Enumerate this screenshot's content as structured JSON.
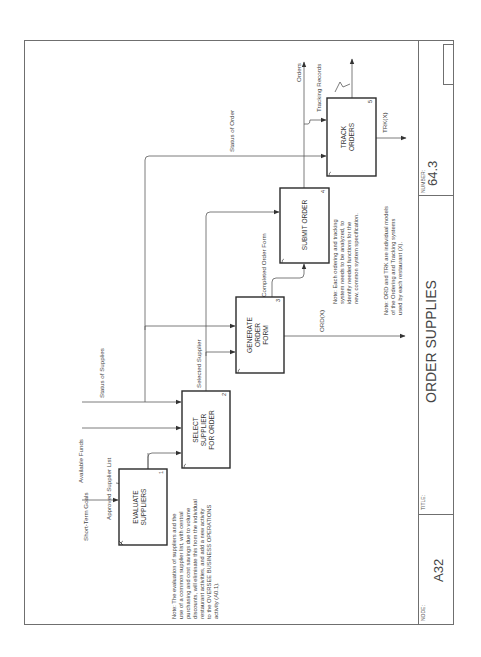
{
  "diagram": {
    "type": "IDEF0",
    "orientation": "rotated-90-ccw",
    "title_block": {
      "node_label": "NODE:",
      "node_value": "A32",
      "title_label": "TITLE:",
      "title_value": "ORDER SUPPLIES",
      "number_label": "NUMBER:",
      "number_value": "64.3"
    },
    "activities": [
      {
        "id": "1",
        "lines": [
          "EVALUATE",
          "SUPPLIERS"
        ]
      },
      {
        "id": "2",
        "lines": [
          "SELECT",
          "SUPPLIER",
          "FOR ORDER"
        ]
      },
      {
        "id": "3",
        "lines": [
          "GENERATE",
          "ORDER",
          "FORM"
        ]
      },
      {
        "id": "4",
        "lines": [
          "SUBMIT ORDER"
        ]
      },
      {
        "id": "5",
        "lines": [
          "TRACK",
          "ORDERS"
        ]
      }
    ],
    "arrows": {
      "short_term_goals": "Short-Term Goals",
      "approved_supplier_list": "Approved Supplier List",
      "available_funds": "Available Funds",
      "status_of_supplies": "Status of Supplies",
      "selected_supplier": "Selected Supplier",
      "completed_order_form": "Completed Order Form",
      "status_of_order": "Status of Order",
      "orders": "Orders",
      "tracking_records": "Tracking Records",
      "ord_x": "ORD(X)",
      "trk_x": "TRK(X)"
    },
    "notes": {
      "note1": [
        "Note:  The evaluation of suppliers and the",
        "use of a common supplier list, with central",
        "purchasing and cost savings due to volume",
        "discounts, will eliminate this from the individual",
        "restaurant activities, and add a new activity",
        "to the OVERSEE BUSINESS OPERATIONS",
        "activity (A0.1)."
      ],
      "note2": [
        "Note:  Each ordering and tracking",
        "system needs to be analyzed, to",
        "identify needed functions for the",
        "new, common system specification."
      ],
      "note3": [
        "Note:  ORD and TRK are individual models",
        "of the Ordering and Tracking systems",
        "used by each restaurant (X)."
      ]
    }
  }
}
